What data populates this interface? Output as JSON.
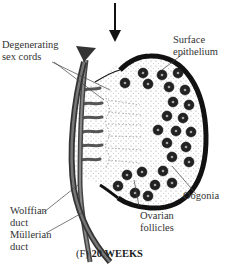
{
  "figure": {
    "panel_letter": "(F)",
    "stage": "20 WEEKS"
  },
  "labels": {
    "degenerating_sex_cords_1": "Degenerating",
    "degenerating_sex_cords_2": "sex cords",
    "surface_epithelium_1": "Surface",
    "surface_epithelium_2": "epithelium",
    "oogonia": "Oogonia",
    "ovarian_follicles_1": "Ovarian",
    "ovarian_follicles_2": "follicles",
    "wolffian_duct_1": "Wolffian",
    "wolffian_duct_2": "duct",
    "mullerian_duct_1": "Müllerian",
    "mullerian_duct_2": "duct"
  },
  "colors": {
    "outline": "#111111",
    "duct": "#555555",
    "follicle": "#222222",
    "stroma_dot": "#888888"
  }
}
